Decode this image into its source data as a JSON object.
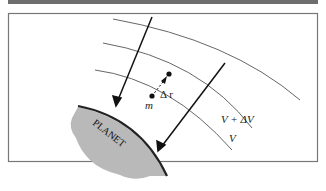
{
  "diagram": {
    "type": "physics-gravitational-potential",
    "labels": {
      "mass": "m",
      "displacement": "Δ r",
      "potential_inner": "V",
      "potential_outer": "V + ΔV",
      "planet": "PLANET"
    },
    "colors": {
      "planet_fill": "#b9b9b9",
      "planet_surface": "#222222",
      "equipotential_lines": "#555555",
      "field_arrows": "#111111",
      "border": "#777777",
      "top_bar": "#6e6e6e"
    }
  }
}
